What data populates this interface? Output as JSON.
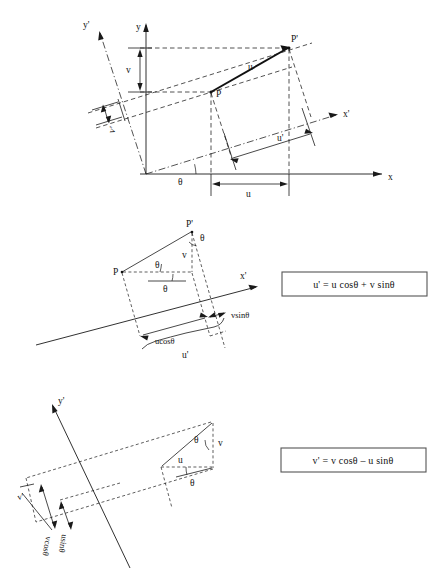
{
  "figure": {
    "panels": [
      {
        "id": "panel-top",
        "name": "original-and-rotated-axes",
        "axes": [
          {
            "name": "x-axis",
            "label": "x"
          },
          {
            "name": "y-axis",
            "label": "y"
          },
          {
            "name": "x-prime-axis",
            "label": "x'"
          },
          {
            "name": "y-prime-axis",
            "label": "y'"
          }
        ],
        "points": [
          {
            "name": "point-p",
            "label": "P"
          },
          {
            "name": "point-p-prime",
            "label": "P'"
          }
        ],
        "dimensions": [
          {
            "name": "u-component",
            "label": "u"
          },
          {
            "name": "v-component",
            "label": "v"
          },
          {
            "name": "u-prime-component",
            "label": "u'"
          },
          {
            "name": "v-prime-component",
            "label": "v'"
          },
          {
            "name": "vector-u-label",
            "label": "u"
          }
        ],
        "angles": [
          {
            "name": "theta-angle",
            "label": "θ"
          }
        ]
      },
      {
        "id": "panel-middle",
        "name": "u-prime-derivation",
        "axes": [
          {
            "name": "x-prime-axis",
            "label": "x'"
          }
        ],
        "points": [
          {
            "name": "point-p",
            "label": "P"
          },
          {
            "name": "point-p-prime",
            "label": "P'"
          }
        ],
        "dimensions": [
          {
            "name": "v-component",
            "label": "v"
          },
          {
            "name": "ucos-theta-dim",
            "label": "ucosθ"
          },
          {
            "name": "vsin-theta-dim",
            "label": "vsinθ"
          },
          {
            "name": "u-prime-brace",
            "label": "u'"
          }
        ],
        "angles": [
          {
            "name": "theta-angle-top",
            "label": "θ"
          },
          {
            "name": "theta-angle-middle",
            "label": "θ"
          },
          {
            "name": "theta-angle-lower",
            "label": "θ"
          }
        ],
        "formula": {
          "name": "u-prime-formula",
          "text": "u' = u cosθ + v sinθ"
        }
      },
      {
        "id": "panel-bottom",
        "name": "v-prime-derivation",
        "axes": [
          {
            "name": "y-prime-axis",
            "label": "y'"
          }
        ],
        "points": [],
        "dimensions": [
          {
            "name": "u-component",
            "label": "u"
          },
          {
            "name": "v-component",
            "label": "v"
          },
          {
            "name": "v-prime-dim",
            "label": "v'"
          },
          {
            "name": "vcos-theta-dim",
            "label": "vcosθ"
          },
          {
            "name": "usin-theta-dim",
            "label": "usinθ"
          }
        ],
        "angles": [
          {
            "name": "theta-angle-upper",
            "label": "θ"
          },
          {
            "name": "theta-angle-lower",
            "label": "θ"
          }
        ],
        "formula": {
          "name": "v-prime-formula",
          "text": "v' = v cosθ – u sinθ"
        }
      }
    ],
    "colors": {
      "ink": "#1a1a1a",
      "background": "#ffffff",
      "box_border": "#555555"
    }
  }
}
